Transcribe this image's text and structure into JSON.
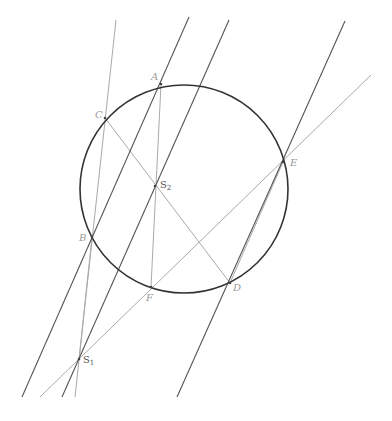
{
  "diagram": {
    "title": "",
    "circle": {
      "cx": 184,
      "cy": 189,
      "r": 104,
      "color": "#333333"
    },
    "points": [
      {
        "id": "A",
        "label": "A",
        "x": 161,
        "y": 84,
        "lx": 151,
        "ly": 80
      },
      {
        "id": "C",
        "label": "C",
        "x": 105,
        "y": 118,
        "lx": 95,
        "ly": 118
      },
      {
        "id": "E",
        "label": "E",
        "x": 283,
        "y": 162,
        "lx": 290,
        "ly": 166
      },
      {
        "id": "S2",
        "label": "S",
        "sub": "2",
        "x": 155,
        "y": 186,
        "lx": 160,
        "ly": 188
      },
      {
        "id": "B",
        "label": "B",
        "x": 92,
        "y": 237,
        "lx": 79,
        "ly": 241
      },
      {
        "id": "F",
        "label": "F",
        "x": 151,
        "y": 287,
        "lx": 146,
        "ly": 301
      },
      {
        "id": "D",
        "label": "D",
        "x": 230,
        "y": 283,
        "lx": 233,
        "ly": 291
      },
      {
        "id": "S1",
        "label": "S",
        "sub": "1",
        "x": 79,
        "y": 359,
        "lx": 83,
        "ly": 363
      }
    ],
    "dark_lines": [
      {
        "name": "line-through-A-B",
        "x1": 189,
        "y1": 17,
        "x2": 22,
        "y2": 397
      },
      {
        "name": "line-through-S2-S1",
        "x1": 229,
        "y1": 20,
        "x2": 62,
        "y2": 397
      },
      {
        "name": "line-through-E-D",
        "x1": 345,
        "y1": 21,
        "x2": 177,
        "y2": 397
      }
    ],
    "light_lines": [
      {
        "name": "line-C-B-S1",
        "x1": 116,
        "y1": 20,
        "x2": 75,
        "y2": 397
      },
      {
        "name": "line-E-F-S1",
        "x1": 371,
        "y1": 75,
        "x2": 40,
        "y2": 397
      },
      {
        "name": "segment-C-D",
        "x1": 105,
        "y1": 118,
        "x2": 230,
        "y2": 283
      },
      {
        "name": "segment-A-F",
        "x1": 161,
        "y1": 84,
        "x2": 151,
        "y2": 287
      },
      {
        "name": "segment-B-S1",
        "x1": 92,
        "y1": 237,
        "x2": 79,
        "y2": 359
      },
      {
        "name": "segment-E-D-chord",
        "x1": 283,
        "y1": 162,
        "x2": 230,
        "y2": 283
      }
    ],
    "colors": {
      "dark": "#555555",
      "light": "#aaaaaa",
      "circle": "#333333"
    }
  }
}
